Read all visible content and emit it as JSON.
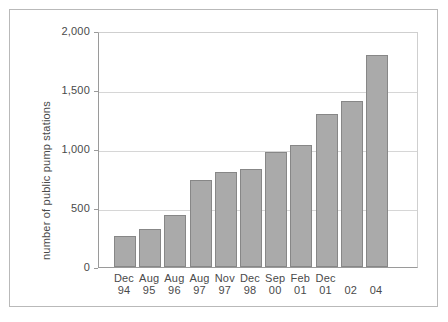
{
  "chart_data": {
    "type": "bar",
    "title": "",
    "xlabel": "",
    "ylabel": "number of public pump stations",
    "ylim": [
      0,
      2000
    ],
    "ytick_values": [
      0,
      500,
      1000,
      1500,
      2000
    ],
    "ytick_labels": [
      "0",
      "500",
      "1,000",
      "1,500",
      "2,000"
    ],
    "grid": "horizontal",
    "legend": "none",
    "bar_color": "#aaaaaa",
    "bar_edge_color": "#878787",
    "categories": [
      {
        "month": "Dec",
        "year": "94"
      },
      {
        "month": "Aug",
        "year": "95"
      },
      {
        "month": "Aug",
        "year": "96"
      },
      {
        "month": "Aug",
        "year": "97"
      },
      {
        "month": "Nov",
        "year": "97"
      },
      {
        "month": "Dec",
        "year": "98"
      },
      {
        "month": "Sep",
        "year": "00"
      },
      {
        "month": "Feb",
        "year": "01"
      },
      {
        "month": "Dec",
        "year": "01"
      },
      {
        "month": "",
        "year": "02"
      },
      {
        "month": "",
        "year": "04"
      }
    ],
    "values": [
      265,
      325,
      440,
      735,
      805,
      830,
      975,
      1030,
      1300,
      1410,
      1800
    ]
  }
}
